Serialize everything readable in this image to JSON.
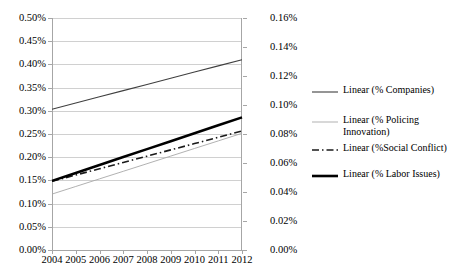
{
  "chart_data": {
    "type": "line",
    "title": "",
    "xlabel": "",
    "ylabel": "",
    "grid": true,
    "legend_position": "right",
    "dual_axis": true,
    "x": [
      2004,
      2005,
      2006,
      2007,
      2008,
      2009,
      2010,
      2011,
      2012
    ],
    "categories": [
      "2004",
      "2005",
      "2006",
      "2007",
      "2008",
      "2009",
      "2010",
      "2011",
      "2012"
    ],
    "axes": {
      "left": {
        "ylim": [
          0.0,
          0.5
        ],
        "tick_step": 0.05,
        "tick_labels": [
          "0.00%",
          "0.05%",
          "0.10%",
          "0.15%",
          "0.20%",
          "0.25%",
          "0.30%",
          "0.35%",
          "0.40%",
          "0.45%",
          "0.50%"
        ],
        "tick_values": [
          0.0,
          0.05,
          0.1,
          0.15,
          0.2,
          0.25,
          0.3,
          0.35,
          0.4,
          0.45,
          0.5
        ]
      },
      "right": {
        "ylim": [
          0.0,
          0.16
        ],
        "tick_step": 0.02,
        "tick_labels": [
          "0.00%",
          "0.02%",
          "0.04%",
          "0.06%",
          "0.08%",
          "0.10%",
          "0.12%",
          "0.14%",
          "0.16%"
        ],
        "tick_values": [
          0.0,
          0.02,
          0.04,
          0.06,
          0.08,
          0.1,
          0.12,
          0.14,
          0.16
        ]
      }
    },
    "series": [
      {
        "name": "Linear (% Companies)",
        "axis": "left",
        "style": "solid",
        "width": 1.1,
        "color": "#3f3f3f",
        "values": [
          0.3035,
          0.3168,
          0.3302,
          0.3435,
          0.3568,
          0.3702,
          0.3835,
          0.3968,
          0.41
        ]
      },
      {
        "name": "Linear (% Policing Innovation)",
        "axis": "left",
        "style": "solid",
        "width": 0.9,
        "color": "#a8a8a8",
        "values": [
          0.1205,
          0.1369,
          0.1533,
          0.1696,
          0.186,
          0.2024,
          0.2188,
          0.2351,
          0.2515
        ]
      },
      {
        "name": "Linear (%Social Conflict)",
        "axis": "left",
        "style": "dashdot",
        "width": 1.6,
        "color": "#1a1a1a",
        "values": [
          0.148,
          0.1616,
          0.1751,
          0.1887,
          0.2022,
          0.2158,
          0.2293,
          0.2429,
          0.2565
        ]
      },
      {
        "name": "Linear (% Labor Issues)",
        "axis": "left",
        "style": "solid",
        "width": 2.6,
        "color": "#000000",
        "values": [
          0.149,
          0.1661,
          0.1832,
          0.2003,
          0.2174,
          0.2345,
          0.2516,
          0.2687,
          0.2858
        ]
      }
    ]
  },
  "legend": {
    "entries": [
      {
        "label": "Linear (% Companies)",
        "swatch": "line-solid-medium"
      },
      {
        "label": "Linear (% Policing\nInnovation)",
        "swatch": "line-solid-thin-gray"
      },
      {
        "label": "Linear (%Social Conflict)",
        "swatch": "line-dashdot"
      },
      {
        "label": "Linear (% Labor Issues)",
        "swatch": "line-solid-thick"
      }
    ]
  },
  "colors": {
    "companies": "#3f3f3f",
    "policing": "#a8a8a8",
    "social_conflict": "#1a1a1a",
    "labor_issues": "#000000",
    "gridline": "#d0d0d0",
    "axis": "#a6a6a6",
    "background": "#ffffff"
  }
}
